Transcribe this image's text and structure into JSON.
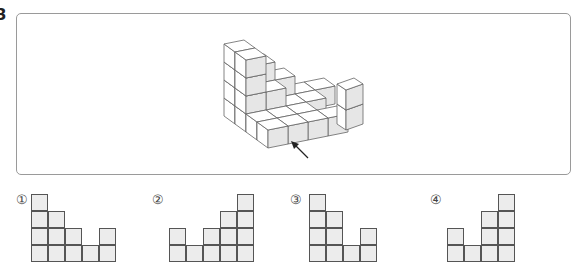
{
  "question": {
    "number": "3"
  },
  "figure": {
    "colors": {
      "front_face": "#e6e6e6",
      "side_face": "#ffffff",
      "top_face": "#ffffff",
      "stroke": "#666666"
    },
    "heightmap_back_to_front": [
      [
        4,
        3,
        2,
        1,
        1
      ],
      [
        4,
        2,
        1,
        1,
        0
      ],
      [
        1,
        1,
        1,
        0,
        0
      ],
      [
        1,
        1,
        1,
        1,
        0
      ]
    ],
    "separate_column_height": 2,
    "arrow_label": "view direction"
  },
  "options": [
    {
      "label": "①",
      "columns": [
        4,
        3,
        2,
        1,
        2
      ]
    },
    {
      "label": "②",
      "columns": [
        2,
        1,
        2,
        3,
        4
      ]
    },
    {
      "label": "③",
      "columns": [
        4,
        3,
        1,
        2
      ]
    },
    {
      "label": "④",
      "columns": [
        2,
        1,
        3,
        4
      ]
    }
  ]
}
